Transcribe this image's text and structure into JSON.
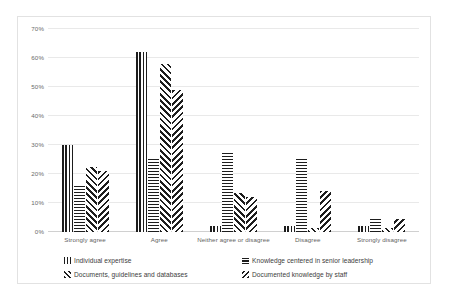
{
  "chart_data": {
    "type": "bar",
    "title": "",
    "subtitle": "",
    "xlabel": "",
    "ylabel": "",
    "grid": true,
    "legend_position": "bottom",
    "ylim": [
      0,
      70
    ],
    "ytick_labels": [
      "70%",
      "60%",
      "50%",
      "40%",
      "30%",
      "20%",
      "10%",
      "0%"
    ],
    "ytick_values": [
      70,
      60,
      50,
      40,
      30,
      20,
      10,
      0
    ],
    "categories": [
      "Strongly agree",
      "Agree",
      "Neither agree or disagree",
      "Disagree",
      "Strongly disagree"
    ],
    "series": [
      {
        "name": "Individual expertise",
        "pattern": "vertical-lines",
        "values": [
          30,
          62,
          2,
          2,
          2
        ]
      },
      {
        "name": "Knowledge centered in senior leadership",
        "pattern": "horizontal-lines",
        "values": [
          16,
          25.5,
          28,
          25.5,
          5
        ]
      },
      {
        "name": "Documents, guidelines and databases",
        "pattern": "forward-diagonal",
        "values": [
          22.5,
          58,
          13.5,
          1.5,
          1.5
        ]
      },
      {
        "name": "Documented knowledge by staff",
        "pattern": "backward-diagonal",
        "values": [
          21,
          49,
          12,
          14,
          4.5
        ]
      }
    ],
    "colors": {
      "bar_ink": "#1d1d1d",
      "bar_background": "#ffffff",
      "gridline": "#e9e9e9",
      "baseline": "#d0d0d0",
      "tick_text": "#6a6a6a",
      "category_text": "#5f5f5f",
      "legend_text": "#3c3c3c",
      "card_border": "#e2e2e2",
      "page_background": "#ffffff"
    }
  }
}
